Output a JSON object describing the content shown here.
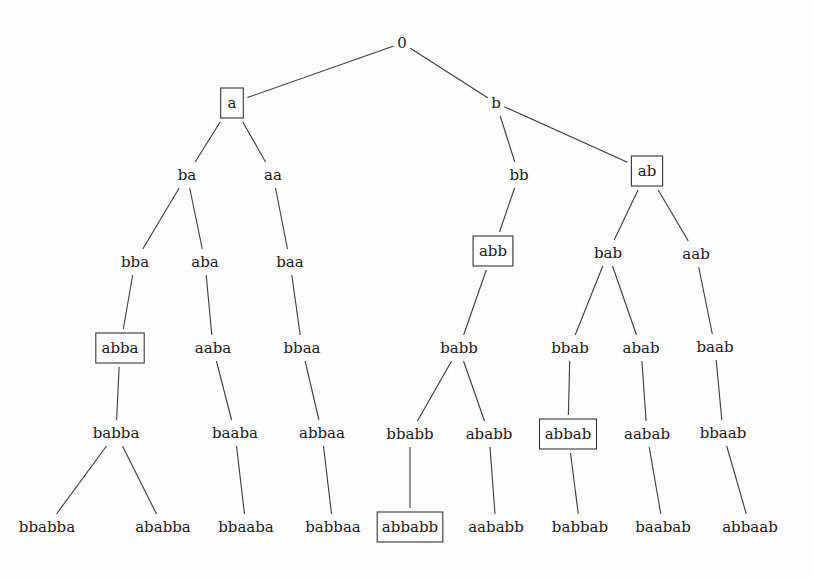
{
  "diagram": {
    "type": "tree",
    "colors": {
      "line": "#3a3a3a",
      "text": "#1a1a1a",
      "box": "#333333",
      "background": "#fdfdfd"
    },
    "nodes": [
      {
        "id": "0",
        "label": "0",
        "x": 402,
        "y": 43,
        "boxed": false,
        "parent": null
      },
      {
        "id": "a",
        "label": "a",
        "x": 232,
        "y": 103,
        "boxed": true,
        "parent": "0"
      },
      {
        "id": "b",
        "label": "b",
        "x": 496,
        "y": 103,
        "boxed": false,
        "parent": "0"
      },
      {
        "id": "ba",
        "label": "ba",
        "x": 187,
        "y": 175,
        "boxed": false,
        "parent": "a"
      },
      {
        "id": "aa",
        "label": "aa",
        "x": 273,
        "y": 175,
        "boxed": false,
        "parent": "a"
      },
      {
        "id": "bb",
        "label": "bb",
        "x": 519,
        "y": 175,
        "boxed": false,
        "parent": "b"
      },
      {
        "id": "ab",
        "label": "ab",
        "x": 647,
        "y": 171,
        "boxed": true,
        "parent": "b"
      },
      {
        "id": "bba",
        "label": "bba",
        "x": 135,
        "y": 262,
        "boxed": false,
        "parent": "ba"
      },
      {
        "id": "aba",
        "label": "aba",
        "x": 205,
        "y": 262,
        "boxed": false,
        "parent": "ba"
      },
      {
        "id": "baa",
        "label": "baa",
        "x": 290,
        "y": 262,
        "boxed": false,
        "parent": "aa"
      },
      {
        "id": "abb",
        "label": "abb",
        "x": 493,
        "y": 251,
        "boxed": true,
        "parent": "bb"
      },
      {
        "id": "bab",
        "label": "bab",
        "x": 608,
        "y": 253,
        "boxed": false,
        "parent": "ab"
      },
      {
        "id": "aab",
        "label": "aab",
        "x": 696,
        "y": 254,
        "boxed": false,
        "parent": "ab"
      },
      {
        "id": "abba",
        "label": "abba",
        "x": 120,
        "y": 348,
        "boxed": true,
        "parent": "bba"
      },
      {
        "id": "aaba",
        "label": "aaba",
        "x": 213,
        "y": 348,
        "boxed": false,
        "parent": "aba"
      },
      {
        "id": "bbaa",
        "label": "bbaa",
        "x": 302,
        "y": 348,
        "boxed": false,
        "parent": "baa"
      },
      {
        "id": "babb",
        "label": "babb",
        "x": 459,
        "y": 348,
        "boxed": false,
        "parent": "abb"
      },
      {
        "id": "bbab",
        "label": "bbab",
        "x": 570,
        "y": 348,
        "boxed": false,
        "parent": "bab"
      },
      {
        "id": "abab",
        "label": "abab",
        "x": 641,
        "y": 348,
        "boxed": false,
        "parent": "bab"
      },
      {
        "id": "baab",
        "label": "baab",
        "x": 715,
        "y": 347,
        "boxed": false,
        "parent": "aab"
      },
      {
        "id": "babba",
        "label": "babba",
        "x": 116,
        "y": 433,
        "boxed": false,
        "parent": "abba"
      },
      {
        "id": "baaba",
        "label": "baaba",
        "x": 235,
        "y": 433,
        "boxed": false,
        "parent": "aaba"
      },
      {
        "id": "abbaa",
        "label": "abbaa",
        "x": 322,
        "y": 433,
        "boxed": false,
        "parent": "bbaa"
      },
      {
        "id": "bbabb",
        "label": "bbabb",
        "x": 410,
        "y": 434,
        "boxed": false,
        "parent": "babb"
      },
      {
        "id": "ababb",
        "label": "ababb",
        "x": 489,
        "y": 434,
        "boxed": false,
        "parent": "babb"
      },
      {
        "id": "abbab",
        "label": "abbab",
        "x": 568,
        "y": 434,
        "boxed": true,
        "parent": "bbab"
      },
      {
        "id": "aabab",
        "label": "aabab",
        "x": 647,
        "y": 434,
        "boxed": false,
        "parent": "abab"
      },
      {
        "id": "bbaab",
        "label": "bbaab",
        "x": 723,
        "y": 433,
        "boxed": false,
        "parent": "baab"
      },
      {
        "id": "bbabba",
        "label": "bbabba",
        "x": 47,
        "y": 527,
        "boxed": false,
        "parent": "babba"
      },
      {
        "id": "ababba",
        "label": "ababba",
        "x": 163,
        "y": 527,
        "boxed": false,
        "parent": "babba"
      },
      {
        "id": "bbaaba",
        "label": "bbaaba",
        "x": 246,
        "y": 527,
        "boxed": false,
        "parent": "baaba"
      },
      {
        "id": "babbaa",
        "label": "babbaa",
        "x": 333,
        "y": 527,
        "boxed": false,
        "parent": "abbaa"
      },
      {
        "id": "abbabb",
        "label": "abbabb",
        "x": 410,
        "y": 527,
        "boxed": true,
        "parent": "bbabb"
      },
      {
        "id": "aababb",
        "label": "aababb",
        "x": 496,
        "y": 527,
        "boxed": false,
        "parent": "ababb"
      },
      {
        "id": "babbab",
        "label": "babbab",
        "x": 580,
        "y": 527,
        "boxed": false,
        "parent": "abbab"
      },
      {
        "id": "baabab",
        "label": "baabab",
        "x": 663,
        "y": 527,
        "boxed": false,
        "parent": "aabab"
      },
      {
        "id": "abbaab",
        "label": "abbaab",
        "x": 750,
        "y": 527,
        "boxed": false,
        "parent": "bbaab"
      }
    ]
  }
}
